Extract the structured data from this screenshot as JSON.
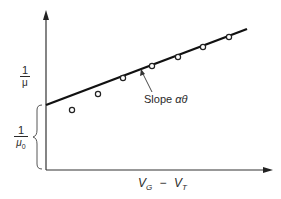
{
  "figure": {
    "y_axis_label_upper": {
      "numerator": "1",
      "denominator": "μ"
    },
    "y_axis_label_intercept": {
      "numerator": "1",
      "denominator": "μ",
      "denominator_subscript": "0"
    },
    "x_axis_label": {
      "v1": "V",
      "v1_sub": "G",
      "minus": "−",
      "v2": "V",
      "v2_sub": "T"
    },
    "slope_annotation": {
      "text": "Slope ",
      "symbol": "αθ"
    },
    "line": {
      "x1": 46,
      "y1": 105,
      "x2": 247,
      "y2": 29
    },
    "axes": {
      "origin_x": 46,
      "origin_y": 170,
      "y_top": 12,
      "x_right": 272
    },
    "data_points": [
      {
        "x": 72,
        "y": 110
      },
      {
        "x": 98,
        "y": 94
      },
      {
        "x": 123,
        "y": 78
      },
      {
        "x": 152,
        "y": 66
      },
      {
        "x": 178,
        "y": 57
      },
      {
        "x": 203,
        "y": 47
      },
      {
        "x": 229,
        "y": 37
      }
    ],
    "colors": {
      "ink": "#1a1a1a",
      "background": "#ffffff"
    }
  }
}
